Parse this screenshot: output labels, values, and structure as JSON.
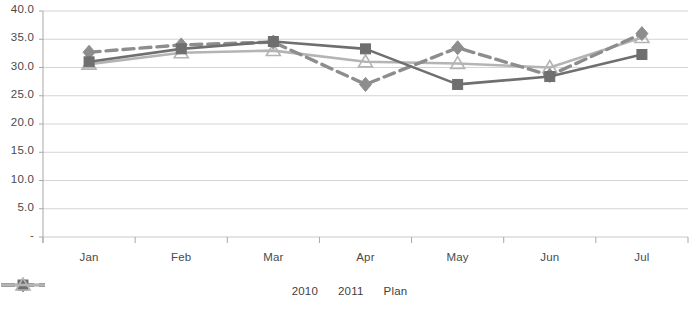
{
  "chart_data": {
    "type": "line",
    "title": "",
    "subtitle": "",
    "xlabel": "",
    "ylabel": "",
    "categories": [
      "Jan",
      "Feb",
      "Mar",
      "Apr",
      "May",
      "Jun",
      "Jul"
    ],
    "ylim": [
      0,
      40
    ],
    "ytick_labels": [
      "40.0",
      "35.0",
      "30.0",
      "25.0",
      "20.0",
      "15.0",
      "10.0",
      "5.0",
      "-"
    ],
    "ytick_values": [
      40,
      35,
      30,
      25,
      20,
      15,
      10,
      5,
      0
    ],
    "grid": true,
    "grid_axis": "y",
    "legend_position": "bottom",
    "series": [
      {
        "name": "2010",
        "values": [
          32.7,
          34.0,
          34.5,
          27.0,
          33.5,
          28.6,
          36.0
        ],
        "color": "#8d8d8d",
        "line_style": "dashed",
        "marker": "diamond"
      },
      {
        "name": "2011",
        "values": [
          31.0,
          33.3,
          34.6,
          33.3,
          27.0,
          28.4,
          32.3
        ],
        "color": "#6f6f6f",
        "line_style": "solid",
        "marker": "square"
      },
      {
        "name": "Plan",
        "values": [
          30.6,
          32.6,
          33.0,
          31.0,
          30.7,
          30.0,
          35.3
        ],
        "color": "#b4b4b4",
        "line_style": "solid",
        "marker": "triangle"
      }
    ]
  },
  "colors": {
    "grid": "#c9c9c9",
    "axis": "#a8a8a8",
    "text": "#444444",
    "background": "#ffffff"
  }
}
